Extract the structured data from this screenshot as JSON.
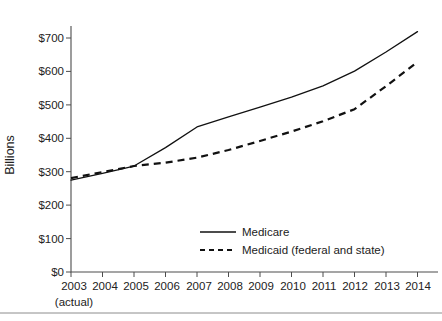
{
  "chart_data": {
    "type": "line",
    "title": "",
    "subtitle": "",
    "xlabel": "",
    "ylabel": "Billions",
    "x": [
      "2003",
      "2004",
      "2005",
      "2006",
      "2007",
      "2008",
      "2009",
      "2010",
      "2011",
      "2012",
      "2013",
      "2014"
    ],
    "x_note": "(actual)",
    "x_note_under": "2003",
    "xlim": [
      "2003",
      "2014"
    ],
    "ylim": [
      0,
      700
    ],
    "ytick_values": [
      0,
      100,
      200,
      300,
      400,
      500,
      600,
      700
    ],
    "ytick_labels": [
      "$0",
      "$100",
      "$200",
      "$300",
      "$400",
      "$500",
      "$600",
      "$700"
    ],
    "grid": false,
    "legend_position": "center-bottom-inside",
    "series": [
      {
        "name": "Medicare",
        "style": "solid",
        "color": "#111111",
        "values": [
          275,
          295,
          317,
          372,
          434,
          464,
          493,
          523,
          557,
          601,
          658,
          719
        ]
      },
      {
        "name": "Medicaid (federal and state)",
        "style": "dashed",
        "color": "#111111",
        "values": [
          281,
          299,
          317,
          327,
          342,
          365,
          392,
          420,
          451,
          487,
          556,
          628
        ]
      }
    ]
  },
  "axis": {
    "y_title": "Billions"
  },
  "legend": {
    "entries": [
      {
        "label": "Medicare",
        "style": "solid"
      },
      {
        "label": "Medicaid (federal and state)",
        "style": "dashed"
      }
    ]
  }
}
